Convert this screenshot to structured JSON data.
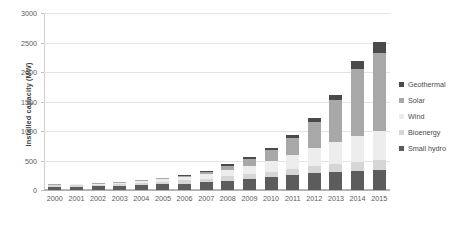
{
  "chart_data": {
    "type": "bar",
    "stacked": true,
    "title": "",
    "xlabel": "",
    "ylabel": "Installed capacity (MW)",
    "categories": [
      "2000",
      "2001",
      "2002",
      "2003",
      "2004",
      "2005",
      "2006",
      "2007",
      "2008",
      "2009",
      "2010",
      "2011",
      "2012",
      "2013",
      "2014",
      "2015"
    ],
    "ylim": [
      0,
      3000
    ],
    "yticks": [
      0,
      500,
      1000,
      1500,
      2000,
      2500,
      3000
    ],
    "ytick_labels": [
      "0",
      "500",
      "1000",
      "1500",
      "2000",
      "2500",
      "3000"
    ],
    "grid": true,
    "legend_position": "right",
    "series": [
      {
        "name": "Small hydro",
        "color": "#5c5c5c",
        "values": [
          55,
          58,
          62,
          70,
          85,
          95,
          110,
          130,
          160,
          185,
          215,
          250,
          280,
          310,
          330,
          345
        ]
      },
      {
        "name": "Bioenergy",
        "color": "#d6d6d6",
        "values": [
          25,
          27,
          30,
          33,
          40,
          45,
          52,
          60,
          72,
          85,
          98,
          112,
          125,
          138,
          150,
          160
        ]
      },
      {
        "name": "Wind",
        "color": "#ededed",
        "values": [
          12,
          14,
          16,
          20,
          30,
          40,
          55,
          75,
          105,
          140,
          185,
          235,
          300,
          370,
          440,
          500
        ]
      },
      {
        "name": "Solar",
        "color": "#a8a8a8",
        "values": [
          3,
          4,
          5,
          7,
          12,
          18,
          28,
          45,
          75,
          120,
          185,
          290,
          450,
          700,
          1130,
          1320
        ]
      },
      {
        "name": "Geothermal",
        "color": "#4a4a4a",
        "values": [
          5,
          6,
          7,
          8,
          10,
          12,
          15,
          18,
          22,
          28,
          35,
          45,
          60,
          85,
          140,
          180
        ]
      }
    ]
  },
  "legend": {
    "items": [
      {
        "label": "Geothermal",
        "color": "#4a4a4a"
      },
      {
        "label": "Solar",
        "color": "#a8a8a8"
      },
      {
        "label": "Wind",
        "color": "#ededed"
      },
      {
        "label": "Bioenergy",
        "color": "#d6d6d6"
      },
      {
        "label": "Small hydro",
        "color": "#5c5c5c"
      }
    ]
  }
}
